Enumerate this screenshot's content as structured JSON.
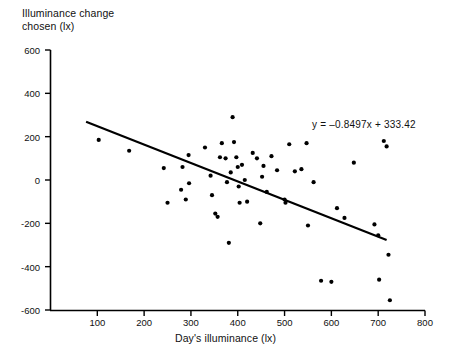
{
  "chart_data": {
    "type": "scatter",
    "title": "",
    "xlabel": "Day's  illuminance (lx)",
    "ylabel": "Illuminance change\nchosen (lx)",
    "xlim": [
      0,
      800
    ],
    "ylim": [
      -600,
      600
    ],
    "xticks": [
      100,
      200,
      300,
      400,
      500,
      600,
      700,
      800
    ],
    "xtick_labels": [
      "100",
      "200",
      "300",
      "400",
      "500",
      "600",
      "700",
      "800"
    ],
    "yticks": [
      -600,
      -400,
      -200,
      0,
      200,
      400,
      600
    ],
    "ytick_labels": [
      "-600",
      "-400",
      "-200",
      "0",
      "200",
      "400",
      "600"
    ],
    "grid": false,
    "legend": null,
    "annotations": [
      {
        "name": "regression-equation",
        "text": "y = –0.8497x + 333.42",
        "x": 660,
        "y": 270
      }
    ],
    "series": [
      {
        "name": "Illuminance change chosen vs day's illuminance",
        "type": "scatter",
        "marker": "filled-circle",
        "color": "#000000",
        "points": [
          [
            103,
            185
          ],
          [
            168,
            135
          ],
          [
            242,
            55
          ],
          [
            250,
            -105
          ],
          [
            279,
            -45
          ],
          [
            282,
            60
          ],
          [
            289,
            -90
          ],
          [
            295,
            115
          ],
          [
            296,
            -15
          ],
          [
            330,
            150
          ],
          [
            342,
            20
          ],
          [
            345,
            -70
          ],
          [
            352,
            -155
          ],
          [
            357,
            -170
          ],
          [
            362,
            105
          ],
          [
            366,
            170
          ],
          [
            374,
            100
          ],
          [
            377,
            -10
          ],
          [
            381,
            -290
          ],
          [
            385,
            35
          ],
          [
            389,
            290
          ],
          [
            392,
            175
          ],
          [
            397,
            105
          ],
          [
            400,
            60
          ],
          [
            402,
            -30
          ],
          [
            404,
            -105
          ],
          [
            409,
            70
          ],
          [
            415,
            0
          ],
          [
            420,
            -100
          ],
          [
            432,
            125
          ],
          [
            441,
            100
          ],
          [
            448,
            -200
          ],
          [
            452,
            15
          ],
          [
            455,
            65
          ],
          [
            462,
            -55
          ],
          [
            472,
            110
          ],
          [
            484,
            45
          ],
          [
            500,
            -90
          ],
          [
            502,
            -105
          ],
          [
            510,
            165
          ],
          [
            522,
            40
          ],
          [
            536,
            50
          ],
          [
            547,
            170
          ],
          [
            550,
            -210
          ],
          [
            562,
            -10
          ],
          [
            578,
            -465
          ],
          [
            600,
            -470
          ],
          [
            612,
            -130
          ],
          [
            628,
            -175
          ],
          [
            648,
            80
          ],
          [
            692,
            -205
          ],
          [
            700,
            -255
          ],
          [
            702,
            -460
          ],
          [
            712,
            180
          ],
          [
            718,
            155
          ],
          [
            722,
            -345
          ],
          [
            725,
            -555
          ]
        ]
      }
    ],
    "fit_line": {
      "name": "least-squares-regression-line",
      "slope": -0.8497,
      "intercept": 333.42,
      "x_start": 76,
      "x_end": 718,
      "color": "#000000"
    }
  }
}
